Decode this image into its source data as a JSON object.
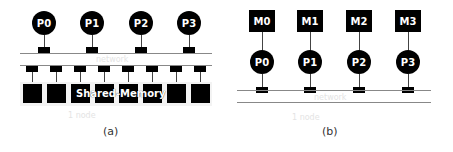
{
  "diagram_a": {
    "caption": "(a)",
    "processors": [
      "P0",
      "P1",
      "P2",
      "P3"
    ],
    "network_label": "network",
    "memory_label": "Shared-Memory",
    "memory_module_count": 8,
    "node_label": "1 node"
  },
  "diagram_b": {
    "caption": "(b)",
    "memories": [
      "M0",
      "M1",
      "M2",
      "M3"
    ],
    "processors": [
      "P0",
      "P1",
      "P2",
      "P3"
    ],
    "network_label": "network",
    "node_label": "1 node"
  }
}
